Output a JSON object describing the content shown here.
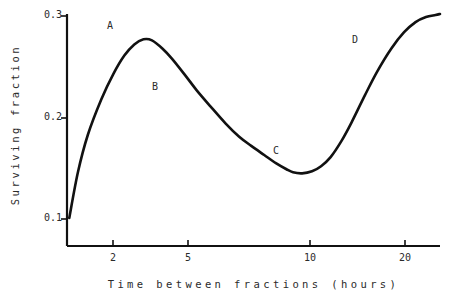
{
  "chart_data": {
    "type": "line",
    "title": "",
    "xlabel": "Time between fractions (hours)",
    "ylabel": "Surviving fraction",
    "xscale": "log",
    "xlim": [
      1.0,
      26.0
    ],
    "ylim": [
      0.085,
      0.305
    ],
    "xticks": [
      2,
      5,
      10,
      20
    ],
    "xtick_labels": [
      "2",
      "5",
      "10",
      "20"
    ],
    "yticks": [
      0.1,
      0.2,
      0.3
    ],
    "ytick_labels": [
      "0.1",
      "0.2",
      "0.3"
    ],
    "grid": false,
    "legend": "none",
    "line_color": "#111111",
    "series": [
      {
        "name": "surviving fraction",
        "x": [
          1.02,
          1.1,
          1.2,
          1.35,
          1.5,
          1.65,
          1.8,
          1.95,
          2.1,
          2.3,
          2.5,
          2.8,
          3.1,
          3.5,
          4.0,
          4.5,
          5.0,
          5.6,
          6.2,
          6.8,
          7.2,
          7.8,
          8.5,
          9.2,
          10.0,
          11.0,
          12.0,
          13.5,
          15.0,
          17.0,
          19.0,
          21.0,
          23.0,
          25.0,
          26.0
        ],
        "y": [
          0.101,
          0.146,
          0.183,
          0.218,
          0.243,
          0.261,
          0.272,
          0.277,
          0.276,
          0.268,
          0.258,
          0.242,
          0.227,
          0.211,
          0.194,
          0.181,
          0.172,
          0.163,
          0.155,
          0.149,
          0.146,
          0.145,
          0.147,
          0.152,
          0.161,
          0.177,
          0.195,
          0.222,
          0.245,
          0.268,
          0.284,
          0.294,
          0.299,
          0.301,
          0.302
        ]
      }
    ],
    "annotations": [
      {
        "label": "A",
        "x": 2.0,
        "y": 0.277,
        "label_x": 110,
        "label_y": 27
      },
      {
        "label": "B",
        "x": 3.5,
        "y": 0.211,
        "label_x": 155,
        "label_y": 88
      },
      {
        "label": "C",
        "x": 8.2,
        "y": 0.146,
        "label_x": 276,
        "label_y": 152
      },
      {
        "label": "D",
        "x": 15.0,
        "y": 0.245,
        "label_x": 355,
        "label_y": 41
      }
    ]
  },
  "axes": {
    "y_tick_labels": [
      "0.3",
      "0.2",
      "0.1"
    ],
    "x_tick_labels": [
      "2",
      "5",
      "10",
      "20"
    ]
  }
}
